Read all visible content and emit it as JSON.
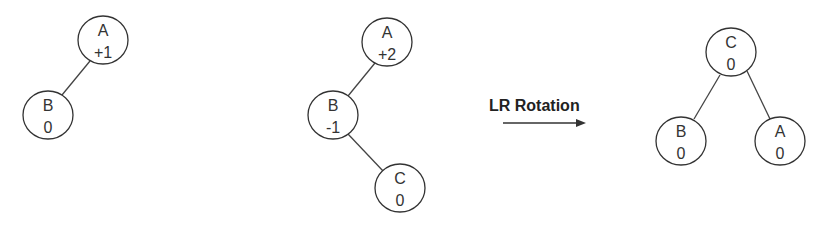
{
  "diagram": {
    "trees": [
      {
        "id": "tree-1",
        "nodes": [
          {
            "key": "A",
            "balance": "+1"
          },
          {
            "key": "B",
            "balance": "0"
          }
        ],
        "edges": [
          [
            "A",
            "B"
          ]
        ]
      },
      {
        "id": "tree-2",
        "nodes": [
          {
            "key": "A",
            "balance": "+2"
          },
          {
            "key": "B",
            "balance": "-1"
          },
          {
            "key": "C",
            "balance": "0"
          }
        ],
        "edges": [
          [
            "A",
            "B"
          ],
          [
            "B",
            "C"
          ]
        ]
      },
      {
        "id": "tree-3",
        "nodes": [
          {
            "key": "C",
            "balance": "0"
          },
          {
            "key": "B",
            "balance": "0"
          },
          {
            "key": "A",
            "balance": "0"
          }
        ],
        "edges": [
          [
            "C",
            "B"
          ],
          [
            "C",
            "A"
          ]
        ]
      }
    ],
    "transition": {
      "label": "LR Rotation",
      "from": "tree-2",
      "to": "tree-3"
    }
  }
}
